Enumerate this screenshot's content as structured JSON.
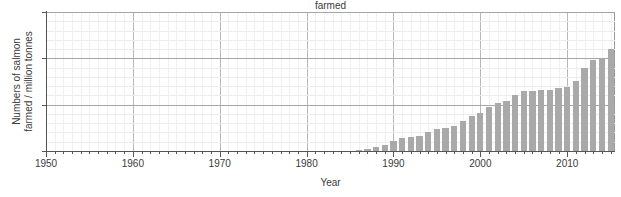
{
  "chart_data": {
    "type": "bar",
    "title": "farmed",
    "xlabel": "Year",
    "ylabel_line1": "Numbers of salmon",
    "ylabel_line2": "farmed / million tonnes",
    "xlim": [
      1950,
      2015.5
    ],
    "ylim": [
      0,
      3
    ],
    "xticks": [
      1950,
      1960,
      1970,
      1980,
      1990,
      2000,
      2010
    ],
    "xtick_labels": [
      "1950",
      "1960",
      "1970",
      "1980",
      "1990",
      "2000",
      "2010"
    ],
    "yticks": [
      0,
      1,
      2,
      3
    ],
    "ytick_labels": [
      "0",
      "1",
      "2",
      "3"
    ],
    "x_minor_tick_step": 1,
    "grid": "major-and-minor",
    "legend": "none",
    "bar_color": "#a9a9a9",
    "categories": [
      1950,
      1951,
      1952,
      1953,
      1954,
      1955,
      1956,
      1957,
      1958,
      1959,
      1960,
      1961,
      1962,
      1963,
      1964,
      1965,
      1966,
      1967,
      1968,
      1969,
      1970,
      1971,
      1972,
      1973,
      1974,
      1975,
      1976,
      1977,
      1978,
      1979,
      1980,
      1981,
      1982,
      1983,
      1984,
      1985,
      1986,
      1987,
      1988,
      1989,
      1990,
      1991,
      1992,
      1993,
      1994,
      1995,
      1996,
      1997,
      1998,
      1999,
      2000,
      2001,
      2002,
      2003,
      2004,
      2005,
      2006,
      2007,
      2008,
      2009,
      2010,
      2011,
      2012,
      2013,
      2014,
      2015
    ],
    "values": [
      0,
      0,
      0,
      0,
      0,
      0,
      0,
      0,
      0,
      0,
      0,
      0,
      0,
      0,
      0,
      0,
      0,
      0,
      0,
      0,
      0,
      0,
      0,
      0,
      0,
      0,
      0,
      0,
      0,
      0,
      0,
      0,
      0,
      0,
      0,
      0,
      0.02,
      0.05,
      0.08,
      0.13,
      0.22,
      0.29,
      0.3,
      0.33,
      0.4,
      0.47,
      0.5,
      0.55,
      0.65,
      0.76,
      0.82,
      0.96,
      1.04,
      1.09,
      1.2,
      1.3,
      1.3,
      1.31,
      1.31,
      1.35,
      1.38,
      1.52,
      1.8,
      1.97,
      2.0,
      2.2
    ]
  }
}
